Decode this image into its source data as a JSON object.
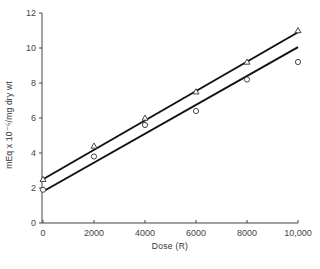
{
  "chart_data": {
    "type": "scatter",
    "title": "",
    "xlabel": "Dose (R)",
    "ylabel": "mEq x 10⁻⁵/mg dry wt",
    "xlim": [
      0,
      10000
    ],
    "ylim": [
      0,
      12
    ],
    "x_ticks": [
      0,
      2000,
      4000,
      6000,
      8000,
      10000
    ],
    "x_tick_labels": [
      "0",
      "2000",
      "4000",
      "6000",
      "8000",
      "10,000"
    ],
    "y_ticks": [
      0,
      2,
      4,
      6,
      8,
      10,
      12
    ],
    "y_tick_labels": [
      "0",
      "2",
      "4",
      "6",
      "8",
      "10",
      "12"
    ],
    "grid": false,
    "legend": null,
    "x": [
      0,
      2000,
      4000,
      6000,
      8000,
      10000
    ],
    "series": [
      {
        "name": "triangles",
        "marker": "triangle",
        "values": [
          2.5,
          4.4,
          6.0,
          7.5,
          9.2,
          11.0
        ],
        "fit_line": {
          "x": [
            0,
            10000
          ],
          "y": [
            2.5,
            10.9
          ]
        }
      },
      {
        "name": "circles",
        "marker": "circle",
        "values": [
          1.9,
          3.8,
          5.6,
          6.4,
          8.2,
          9.2
        ],
        "fit_line": {
          "x": [
            0,
            10000
          ],
          "y": [
            1.8,
            10.05
          ]
        }
      }
    ]
  }
}
